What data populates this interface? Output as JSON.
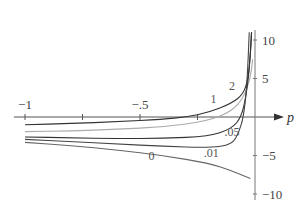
{
  "chart_data": {
    "type": "line",
    "title": "",
    "xlabel": "p",
    "ylabel": "",
    "xlim": [
      -1,
      0.05
    ],
    "ylim": [
      -11,
      11
    ],
    "x_ticks": [
      {
        "value": -1,
        "label": "−1"
      },
      {
        "value": -0.75,
        "label": ""
      },
      {
        "value": -0.5,
        "label": "−.5"
      },
      {
        "value": -0.25,
        "label": ""
      }
    ],
    "y_ticks": [
      {
        "value": 10,
        "label": "10"
      },
      {
        "value": 5,
        "label": "5"
      },
      {
        "value": -5,
        "label": "−5"
      },
      {
        "value": -10,
        "label": "−10"
      }
    ],
    "grid": false,
    "legend": "inline curve labels",
    "series": [
      {
        "name": "1",
        "color": "#333333",
        "label_pos": [
          -0.18,
          1.8
        ],
        "points": [
          [
            -1,
            -1.0
          ],
          [
            -0.8,
            -0.85
          ],
          [
            -0.6,
            -0.6
          ],
          [
            -0.4,
            -0.3
          ],
          [
            -0.3,
            0.0
          ],
          [
            -0.2,
            0.6
          ],
          [
            -0.1,
            1.8
          ],
          [
            -0.05,
            3.0
          ],
          [
            -0.03,
            5.0
          ],
          [
            -0.02,
            8.0
          ],
          [
            -0.015,
            11
          ]
        ]
      },
      {
        "name": "2",
        "color": "#aaaaaa",
        "label_pos": [
          -0.1,
          3.5
        ],
        "points": [
          [
            -1,
            -1.9
          ],
          [
            -0.8,
            -1.8
          ],
          [
            -0.6,
            -1.6
          ],
          [
            -0.4,
            -1.3
          ],
          [
            -0.2,
            -0.5
          ],
          [
            -0.1,
            0.8
          ],
          [
            -0.05,
            2.5
          ],
          [
            -0.02,
            5.0
          ],
          [
            -0.01,
            7.5
          ]
        ]
      },
      {
        "name": ".05",
        "color": "#333333",
        "label_pos": [
          -0.1,
          -2.5
        ],
        "points": [
          [
            -1,
            -2.6
          ],
          [
            -0.8,
            -2.7
          ],
          [
            -0.6,
            -2.8
          ],
          [
            -0.4,
            -2.8
          ],
          [
            -0.2,
            -2.5
          ],
          [
            -0.1,
            -1.5
          ],
          [
            -0.06,
            0.0
          ],
          [
            -0.04,
            2.5
          ],
          [
            -0.025,
            6.0
          ],
          [
            -0.015,
            11
          ]
        ]
      },
      {
        "name": ".01",
        "color": "#444444",
        "label_pos": [
          -0.19,
          -5.2
        ],
        "points": [
          [
            -1,
            -2.9
          ],
          [
            -0.8,
            -3.2
          ],
          [
            -0.6,
            -3.5
          ],
          [
            -0.4,
            -3.8
          ],
          [
            -0.2,
            -4.0
          ],
          [
            -0.1,
            -3.6
          ],
          [
            -0.07,
            -2.0
          ],
          [
            -0.05,
            0.0
          ],
          [
            -0.035,
            4.0
          ],
          [
            -0.025,
            11
          ]
        ]
      },
      {
        "name": "0",
        "color": "#666666",
        "label_pos": [
          -0.45,
          -5.6
        ],
        "points": [
          [
            -1,
            -3.3
          ],
          [
            -0.8,
            -3.7
          ],
          [
            -0.6,
            -4.3
          ],
          [
            -0.4,
            -5.0
          ],
          [
            -0.2,
            -6.0
          ],
          [
            -0.1,
            -7.0
          ],
          [
            -0.02,
            -8.0
          ]
        ]
      }
    ]
  }
}
